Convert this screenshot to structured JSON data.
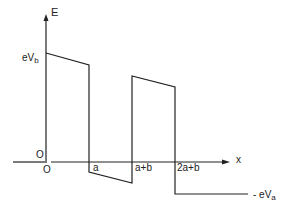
{
  "diagram": {
    "type": "energy-band potential profile",
    "axes": {
      "y_label": "E",
      "x_label": "x",
      "origin_label_y": "O",
      "origin_label_x": "O"
    },
    "levels": {
      "top_label": "eV",
      "top_sub": "b",
      "bottom_label": "- eV",
      "bottom_sub": "a"
    },
    "x_ticks": [
      "a",
      "a+b",
      "2a+b"
    ],
    "colors": {
      "line": "#222222",
      "background": "#ffffff"
    }
  }
}
